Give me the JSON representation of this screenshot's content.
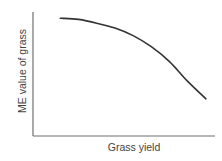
{
  "chart_data": {
    "type": "line",
    "title": "",
    "xlabel": "Grass yield",
    "ylabel": "ME value of grass",
    "xlim": [
      0,
      1
    ],
    "ylim": [
      0,
      1
    ],
    "grid": false,
    "legend": null,
    "x_ticks": [],
    "y_ticks": [],
    "series": [
      {
        "name": "ME value vs yield",
        "x": [
          0.15,
          0.25,
          0.35,
          0.45,
          0.55,
          0.65,
          0.75,
          0.85,
          0.95
        ],
        "y": [
          0.95,
          0.94,
          0.91,
          0.87,
          0.81,
          0.72,
          0.6,
          0.44,
          0.3
        ]
      }
    ]
  }
}
